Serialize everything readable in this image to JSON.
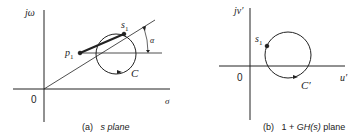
{
  "figure": {
    "panel_a": {
      "caption_tag": "(a)",
      "caption_text": "s plane",
      "y_axis_label": "jω",
      "x_axis_label": "σ",
      "origin_label": "0",
      "point_p1": "p",
      "point_p1_sub": "1",
      "point_s1": "s",
      "point_s1_sub": "1",
      "contour_label": "C",
      "angle_label": "α"
    },
    "panel_b": {
      "caption_tag": "(b)",
      "caption_prefix": "1 + ",
      "caption_func": "GH(s)",
      "caption_suffix": " plane",
      "y_axis_label": "jv′",
      "x_axis_label": "u′",
      "origin_label": "0",
      "point_s1": "s",
      "point_s1_sub": "1",
      "contour_label": "C′"
    },
    "colors": {
      "ink": "#222222",
      "background": "#ffffff"
    }
  }
}
